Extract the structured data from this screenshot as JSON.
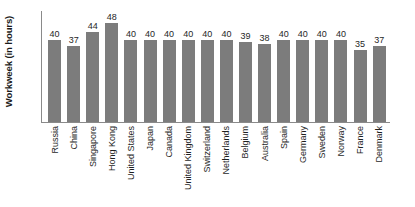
{
  "chart_data": {
    "type": "bar",
    "title": "",
    "subtitle": "",
    "xlabel": "",
    "ylabel": "Workweek (in hours)",
    "ylim": [
      0,
      54
    ],
    "grid": false,
    "legend": null,
    "bar_color": "#7c7c7c",
    "axis_color": "#8a8a8a",
    "text_color": "#1f1f1f",
    "categories": [
      "Russia",
      "China",
      "Singapore",
      "Hong Kong",
      "United States",
      "Japan",
      "Canada",
      "United Kingdom",
      "Switzerland",
      "Netherlands",
      "Belgium",
      "Australia",
      "Spain",
      "Germany",
      "Sweden",
      "Norway",
      "France",
      "Denmark"
    ],
    "values": [
      40,
      37,
      44,
      48,
      40,
      40,
      40,
      40,
      40,
      40,
      39,
      38,
      40,
      40,
      40,
      40,
      35,
      37
    ],
    "value_labels": [
      "40",
      "37",
      "44",
      "48",
      "40",
      "40",
      "40",
      "40",
      "40",
      "40",
      "39",
      "38",
      "40",
      "40",
      "40",
      "40",
      "35",
      "37"
    ]
  }
}
